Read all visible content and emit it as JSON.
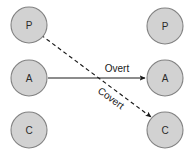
{
  "diagram": {
    "type": "node-edge-diagram",
    "background_color": "#ffffff",
    "canvas": {
      "width": 192,
      "height": 160
    },
    "node_style": {
      "fill_color": "#d2d2d2",
      "stroke_color": "#828282",
      "radius": 18,
      "label_color": "#2b2b2b"
    },
    "edge_style": {
      "color": "#1a1a1a",
      "solid_label_color": "#1a1a1a",
      "dashed_label_color": "#1a1a1a"
    },
    "left_column": {
      "name": "sender-column",
      "nodes": [
        {
          "id": "left-p",
          "label": "P",
          "cx": 29,
          "cy": 25
        },
        {
          "id": "left-a",
          "label": "A",
          "cx": 29,
          "cy": 78
        },
        {
          "id": "left-c",
          "label": "C",
          "cx": 29,
          "cy": 130
        }
      ]
    },
    "right_column": {
      "name": "receiver-column",
      "nodes": [
        {
          "id": "right-p",
          "label": "P",
          "cx": 165,
          "cy": 26
        },
        {
          "id": "right-a",
          "label": "A",
          "cx": 165,
          "cy": 78
        },
        {
          "id": "right-c",
          "label": "C",
          "cx": 165,
          "cy": 130
        }
      ]
    },
    "edges": [
      {
        "id": "overt-edge",
        "label": "Overt",
        "style": "solid",
        "from": "left-a",
        "to": "right-a",
        "x1": 48,
        "y1": 78,
        "x2": 145,
        "y2": 78,
        "label_x": 117,
        "label_y": 72,
        "label_rotation": 0
      },
      {
        "id": "covert-edge",
        "label": "Covert",
        "style": "dashed",
        "from": "left-p",
        "to": "right-c",
        "x1": 41,
        "y1": 35,
        "x2": 151,
        "y2": 117,
        "label_x": 109,
        "label_y": 101,
        "label_rotation": 36
      }
    ]
  }
}
